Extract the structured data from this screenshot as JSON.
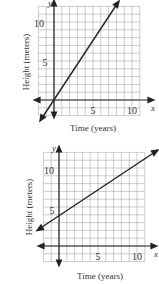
{
  "chart_data": [
    {
      "type": "line",
      "title": "",
      "xlabel": "Time (years)",
      "ylabel": "Height (meters)",
      "x_axis_name": "x",
      "y_axis_name": "y",
      "xticks": [
        5,
        10
      ],
      "yticks": [
        5,
        10
      ],
      "xlim": [
        -2,
        11
      ],
      "ylim": [
        -2,
        12
      ],
      "grid": true,
      "series": [
        {
          "name": "line",
          "x": [
            -1,
            0,
            2,
            4,
            6,
            8
          ],
          "values": [
            -1.5,
            0,
            3,
            6,
            9,
            12
          ]
        }
      ],
      "equation": "y = 1.5x"
    },
    {
      "type": "line",
      "title": "",
      "xlabel": "Time (years)",
      "ylabel": "Height (meters)",
      "x_axis_name": "x",
      "y_axis_name": "y",
      "xticks": [
        5,
        10
      ],
      "yticks": [
        5,
        10
      ],
      "xlim": [
        -2,
        11
      ],
      "ylim": [
        -2,
        12
      ],
      "grid": true,
      "series": [
        {
          "name": "line",
          "x": [
            -2,
            0,
            3,
            6,
            9,
            12
          ],
          "values": [
            2.67,
            4,
            6,
            8,
            10,
            12
          ]
        }
      ],
      "equation": "y = (2/3)x + 4"
    }
  ],
  "charts": [
    {
      "xlabel": "Time (years)",
      "ylabel": "Height (meters)",
      "x_name": "x",
      "y_name": "y",
      "x5": "5",
      "x10": "10",
      "y5": "5",
      "y10": "10"
    },
    {
      "xlabel": "Time (years)",
      "ylabel": "Height (meters)",
      "x_name": "x",
      "y_name": "y",
      "x5": "5",
      "x10": "10",
      "y5": "5",
      "y10": "10"
    }
  ]
}
